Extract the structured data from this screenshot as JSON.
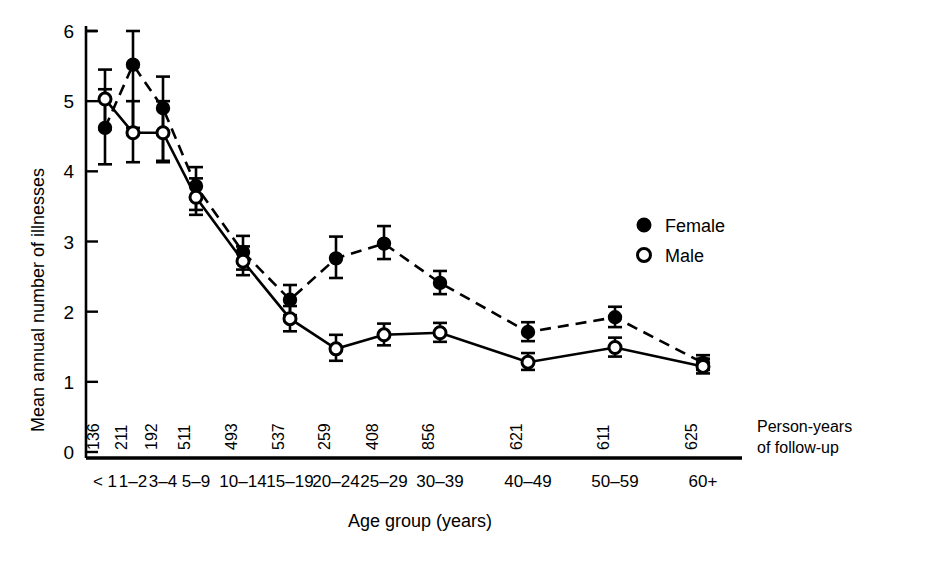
{
  "chart_data": {
    "type": "line",
    "title": "",
    "xlabel": "Age group (years)",
    "ylabel": "Mean annual number of illnesses",
    "ylim": [
      0,
      6
    ],
    "yticks": [
      0,
      1,
      2,
      3,
      4,
      5,
      6
    ],
    "grid": false,
    "legend_position": "right-inside",
    "categories": [
      "< 1",
      "1–2",
      "3–4",
      "5–9",
      "10–14",
      "15–19",
      "20–24",
      "25–29",
      "30–39",
      "40–49",
      "50–59",
      "60+"
    ],
    "secondary_axis": {
      "label_line1": "Person-years",
      "label_line2": "of follow-up",
      "values": [
        136,
        211,
        192,
        511,
        493,
        537,
        259,
        408,
        856,
        621,
        611,
        625
      ]
    },
    "series": [
      {
        "name": "Female",
        "marker": "filled-circle",
        "linestyle": "dashed",
        "values": [
          4.62,
          5.52,
          4.9,
          3.79,
          2.85,
          2.17,
          2.76,
          2.97,
          2.41,
          1.71,
          1.92,
          1.27
        ],
        "err_low": [
          4.1,
          4.62,
          4.15,
          3.45,
          2.6,
          1.95,
          2.48,
          2.75,
          2.25,
          1.58,
          1.78,
          1.17
        ],
        "err_high": [
          5.17,
          6.0,
          5.35,
          4.06,
          3.08,
          2.38,
          3.07,
          3.22,
          2.58,
          1.85,
          2.07,
          1.38
        ]
      },
      {
        "name": "Male",
        "marker": "open-circle",
        "linestyle": "solid",
        "values": [
          5.03,
          4.55,
          4.55,
          3.63,
          2.72,
          1.9,
          1.47,
          1.67,
          1.7,
          1.28,
          1.49,
          1.22
        ],
        "err_low": [
          4.6,
          4.13,
          4.13,
          3.38,
          2.52,
          1.72,
          1.3,
          1.52,
          1.57,
          1.17,
          1.36,
          1.12
        ],
        "err_high": [
          5.45,
          5.0,
          5.0,
          3.9,
          2.93,
          2.08,
          1.67,
          1.83,
          1.84,
          1.41,
          1.63,
          1.33
        ]
      }
    ]
  },
  "legend": {
    "entries": [
      {
        "label": "Female",
        "marker": "filled-circle"
      },
      {
        "label": "Male",
        "marker": "open-circle"
      }
    ]
  }
}
